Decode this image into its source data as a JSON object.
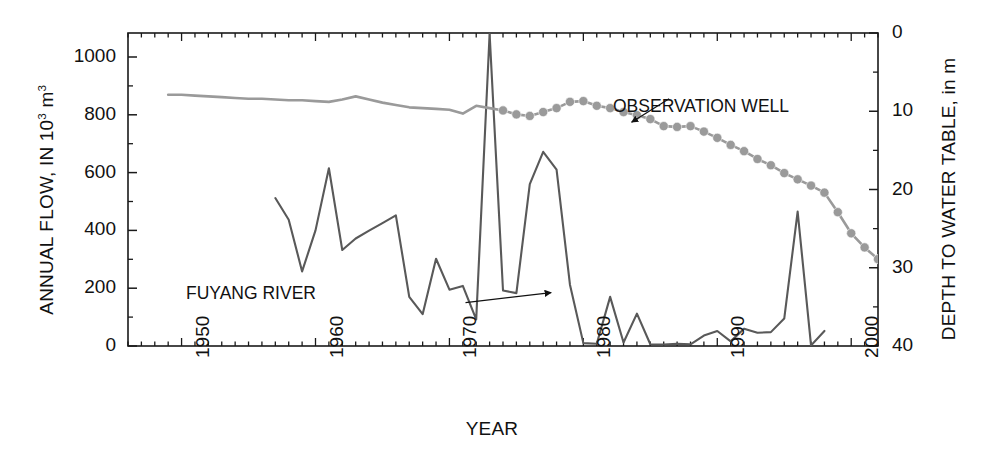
{
  "chart_data": {
    "type": "line",
    "title": "",
    "xlabel": "YEAR",
    "ylabel_left": "ANNUAL FLOW, IN 10³ m³",
    "ylabel_right": "DEPTH TO WATER TABLE, in m",
    "xlim": [
      1946,
      2002
    ],
    "xticks_major": [
      1950,
      1960,
      1970,
      1980,
      1990,
      2000
    ],
    "xticks_minor_interval": 1,
    "ylim_left": [
      0,
      1080
    ],
    "yticks_left": [
      0,
      200,
      400,
      600,
      800,
      1000
    ],
    "yticks_left_minor": [
      100,
      300,
      500,
      700,
      900
    ],
    "ylim_right": [
      0,
      40
    ],
    "yticks_right": [
      0,
      10,
      20,
      30,
      40
    ],
    "yticks_right_minor": [
      5,
      15,
      25,
      35
    ],
    "right_axis_inverted": true,
    "grid": false,
    "legend_position": "in-plot annotations with leader arrows",
    "series": [
      {
        "name": "FUYANG RIVER",
        "axis": "left",
        "units": "10^3 m^3",
        "color": "#595959",
        "marker": "none",
        "label_anchor_x": 1963.0,
        "label_anchor_y": 150,
        "arrow_to_x": 1978.2,
        "arrow_to_y": 170,
        "points": [
          [
            1957,
            512
          ],
          [
            1958,
            437
          ],
          [
            1959,
            258
          ],
          [
            1960,
            400
          ],
          [
            1961,
            615
          ],
          [
            1962,
            332
          ],
          [
            1963,
            372
          ],
          [
            1964,
            399
          ],
          [
            1965,
            425
          ],
          [
            1966,
            452
          ],
          [
            1967,
            170
          ],
          [
            1968,
            110
          ],
          [
            1969,
            302
          ],
          [
            1970,
            195
          ],
          [
            1971,
            208
          ],
          [
            1972,
            92
          ],
          [
            1973,
            1080
          ],
          [
            1974,
            192
          ],
          [
            1975,
            183
          ],
          [
            1976,
            560
          ],
          [
            1977,
            672
          ],
          [
            1978,
            610
          ],
          [
            1979,
            212
          ],
          [
            1980,
            10
          ],
          [
            1981,
            8
          ],
          [
            1982,
            170
          ],
          [
            1983,
            12
          ],
          [
            1984,
            112
          ],
          [
            1985,
            6
          ],
          [
            1986,
            5
          ],
          [
            1987,
            8
          ],
          [
            1988,
            6
          ],
          [
            1989,
            36
          ],
          [
            1990,
            52
          ],
          [
            1991,
            16
          ],
          [
            1992,
            60
          ],
          [
            1993,
            46
          ],
          [
            1994,
            48
          ],
          [
            1995,
            95
          ],
          [
            1996,
            465
          ],
          [
            1997,
            2
          ],
          [
            1998,
            52
          ]
        ]
      },
      {
        "name": "OBSERVATION WELL",
        "axis": "right",
        "units": "m",
        "color": "#9a9a9a",
        "marker": "circle",
        "marker_start_year": 1974,
        "label_anchor_x": 1985.5,
        "label_anchor_y": 7.4,
        "arrow_to_x": 1983.4,
        "arrow_to_y": 12.1,
        "points": [
          [
            1949,
            7.9
          ],
          [
            1950,
            7.9
          ],
          [
            1951,
            8.0
          ],
          [
            1952,
            8.1
          ],
          [
            1953,
            8.2
          ],
          [
            1954,
            8.3
          ],
          [
            1955,
            8.4
          ],
          [
            1956,
            8.4
          ],
          [
            1957,
            8.5
          ],
          [
            1958,
            8.6
          ],
          [
            1959,
            8.6
          ],
          [
            1960,
            8.7
          ],
          [
            1961,
            8.8
          ],
          [
            1962,
            8.5
          ],
          [
            1963,
            8.1
          ],
          [
            1964,
            8.5
          ],
          [
            1965,
            8.9
          ],
          [
            1966,
            9.2
          ],
          [
            1967,
            9.5
          ],
          [
            1968,
            9.6
          ],
          [
            1969,
            9.7
          ],
          [
            1970,
            9.8
          ],
          [
            1971,
            10.3
          ],
          [
            1972,
            9.3
          ],
          [
            1973,
            9.6
          ],
          [
            1974,
            9.9
          ],
          [
            1975,
            10.4
          ],
          [
            1976,
            10.6
          ],
          [
            1977,
            10.1
          ],
          [
            1978,
            9.6
          ],
          [
            1979,
            8.8
          ],
          [
            1980,
            8.7
          ],
          [
            1981,
            9.3
          ],
          [
            1982,
            9.6
          ],
          [
            1983,
            10.1
          ],
          [
            1984,
            10.5
          ],
          [
            1985,
            11.0
          ],
          [
            1986,
            11.9
          ],
          [
            1987,
            12.0
          ],
          [
            1988,
            11.9
          ],
          [
            1989,
            12.6
          ],
          [
            1990,
            13.4
          ],
          [
            1991,
            14.3
          ],
          [
            1992,
            15.1
          ],
          [
            1993,
            16.1
          ],
          [
            1994,
            16.9
          ],
          [
            1995,
            17.9
          ],
          [
            1996,
            18.7
          ],
          [
            1997,
            19.5
          ],
          [
            1998,
            20.4
          ],
          [
            1999,
            22.9
          ],
          [
            2000,
            25.6
          ],
          [
            2001,
            27.4
          ],
          [
            2002,
            28.9
          ],
          [
            2003,
            29.7
          ],
          [
            2004,
            30.2
          ],
          [
            2005,
            31.4
          ]
        ]
      }
    ],
    "annotations": [
      {
        "text": "OBSERVATION WELL",
        "kind": "series-label"
      },
      {
        "text": "FUYANG RIVER",
        "kind": "series-label"
      }
    ]
  },
  "labels": {
    "xlabel": "YEAR",
    "ylabel_left_main": "ANNUAL FLOW, IN 10",
    "ylabel_left_sup1": "3",
    "ylabel_left_mid": " m",
    "ylabel_left_sup2": "3",
    "ylabel_right": "DEPTH TO WATER TABLE, in m",
    "series_fuyang": "FUYANG RIVER",
    "series_well": "OBSERVATION WELL"
  },
  "ticks": {
    "left": [
      "1000",
      "800",
      "600",
      "400",
      "200",
      "0"
    ],
    "right": [
      "0",
      "10",
      "20",
      "30",
      "40"
    ],
    "bottom": [
      "1950",
      "1960",
      "1970",
      "1980",
      "1990",
      "2000"
    ]
  },
  "colors": {
    "fuyang_river": "#595959",
    "observation_well": "#9a9a9a",
    "axis": "#1a1a1a",
    "text": "#111111",
    "background": "#ffffff"
  }
}
